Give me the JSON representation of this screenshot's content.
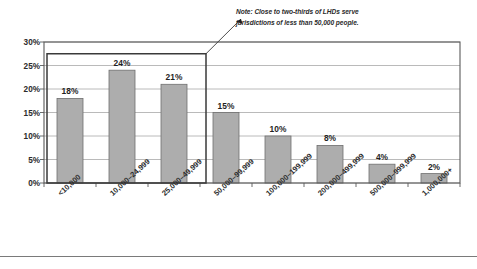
{
  "chart_data": {
    "type": "bar",
    "title": "",
    "subtitle": "",
    "xlabel": "",
    "ylabel": "",
    "categories": [
      "<10,000",
      "10,000–24,999",
      "25,000–49,999",
      "50,000–99,999",
      "100,000–199,999",
      "200,000–499,999",
      "500,000–999,999",
      "1,000,000+"
    ],
    "values": [
      18,
      24,
      21,
      15,
      10,
      8,
      4,
      2
    ],
    "value_labels": [
      "18%",
      "24%",
      "21%",
      "15%",
      "10%",
      "8%",
      "4%",
      "2%"
    ],
    "ylim": [
      0,
      30
    ],
    "ytick_values": [
      0,
      5,
      10,
      15,
      20,
      25,
      30
    ],
    "ytick_labels": [
      "0%",
      "5%",
      "10%",
      "15%",
      "20%",
      "25%",
      "30%"
    ],
    "grid": true,
    "legend": "none",
    "bar_color": "#adadad",
    "bar_edge_color": "#6f6f6f",
    "gridline_color": "#a8a8a8",
    "axis_color": "#5a5a5a",
    "annotations": [
      {
        "name": "two-thirds-note",
        "lines": [
          "Note: Close to two-thirds of LHDs serve",
          "jurisdictions of less than 50,000 people."
        ],
        "text": "Note: Close to two-thirds of LHDs serve jurisdictions of less than 50,000 people.",
        "points_to_categories": [
          "<10,000",
          "10,000–24,999",
          "25,000–49,999"
        ],
        "highlight_box_color": "#3a3a3a"
      }
    ]
  },
  "note": {
    "line1": "Note: Close to two-thirds of LHDs serve",
    "line2": "jurisdictions of less than 50,000 people."
  }
}
